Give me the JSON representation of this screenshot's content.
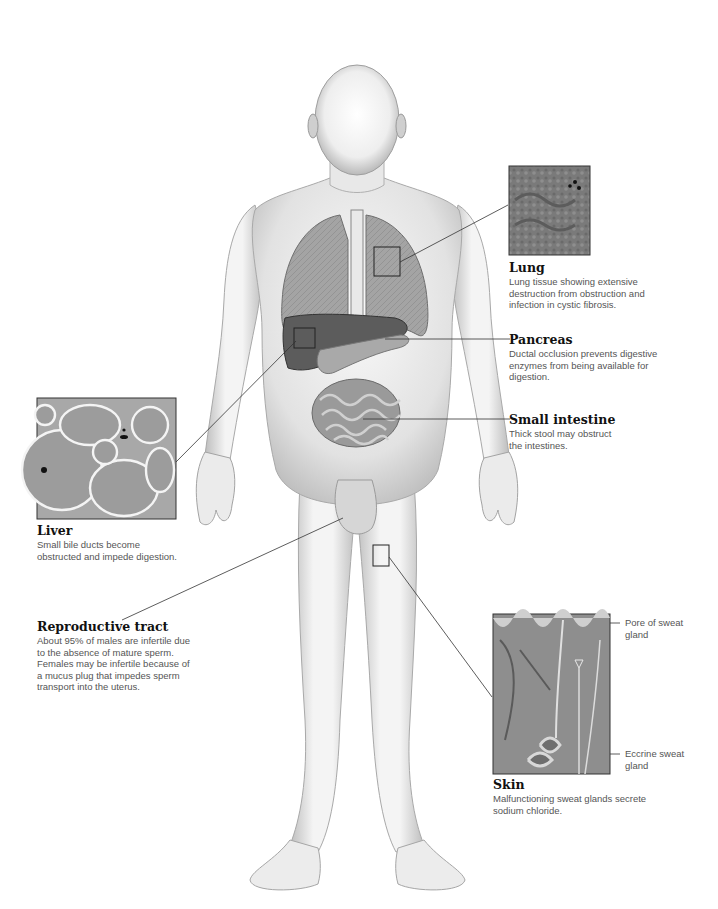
{
  "figure": {
    "callouts": {
      "lung": {
        "title": "Lung",
        "desc_lines": [
          "Lung tissue showing extensive",
          "destruction from obstruction and",
          "infection in cystic fibrosis."
        ]
      },
      "pancreas": {
        "title": "Pancreas",
        "desc_lines": [
          "Ductal occlusion prevents digestive",
          "enzymes from being available for",
          "digestion."
        ]
      },
      "small_intestine": {
        "title": "Small intestine",
        "desc_lines": [
          "Thick stool may obstruct",
          "the intestines."
        ]
      },
      "liver": {
        "title": "Liver",
        "desc_lines": [
          "Small bile ducts become",
          "obstructed and impede digestion."
        ]
      },
      "reproductive": {
        "title": "Reproductive tract",
        "desc_lines": [
          "About 95% of males are infertile due",
          "to the absence of mature sperm.",
          "Females may be infertile because of",
          "a mucus plug that impedes sperm",
          "transport into the uterus."
        ]
      },
      "skin": {
        "title": "Skin",
        "desc_lines": [
          "Malfunctioning sweat glands secrete",
          "sodium chloride."
        ],
        "sublabels": {
          "pore": [
            "Pore of sweat",
            "gland"
          ],
          "eccrine": [
            "Eccrine sweat",
            "gland"
          ]
        }
      }
    },
    "colors": {
      "body_fill": "#e6e6e6",
      "body_shade": "#bdbdbd",
      "organ_lung": "#9a9a9a",
      "organ_liver": "#5a5a5a",
      "organ_pancreas": "#a8a8a8",
      "organ_intestine": "#8c8c8c",
      "leader_line": "#333333"
    }
  }
}
